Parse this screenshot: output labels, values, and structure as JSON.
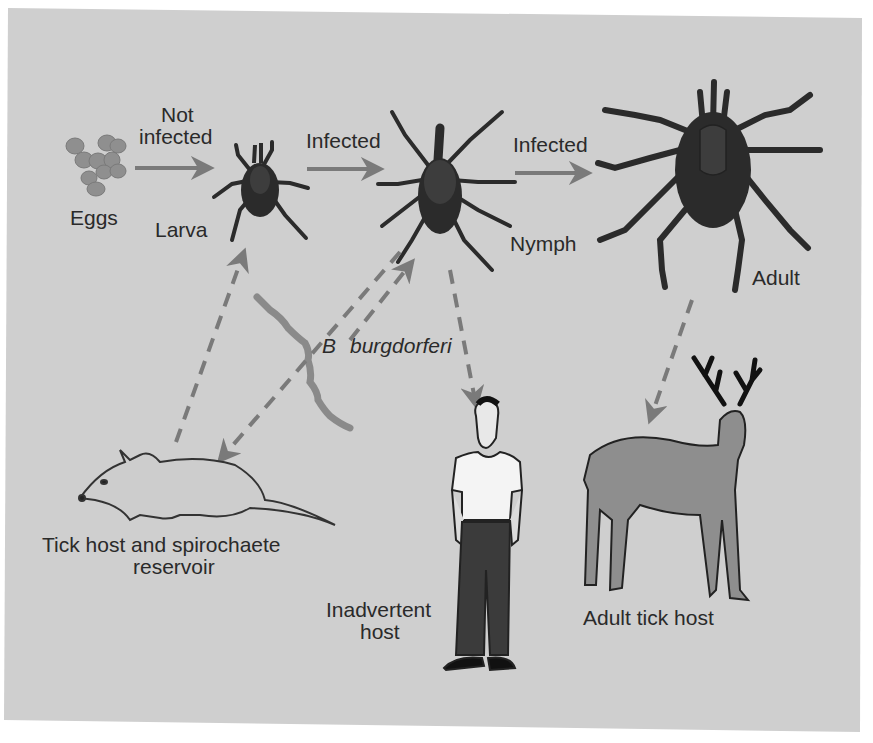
{
  "diagram": {
    "colors": {
      "panel": "#cfcfcf",
      "tick": "#2b2b2b",
      "tick_shield": "#3d3d3d",
      "arrow": "#7a7a7a",
      "eggs": "#8f8f8f",
      "spirochete": "#8a8a8a",
      "deer": "#8e8e8e",
      "mouse": "#cdcdcd",
      "text": "#2a2a2a"
    },
    "stages": {
      "eggs": "Eggs",
      "larva": "Larva",
      "nymph": "Nymph",
      "adult": "Adult"
    },
    "transitions": {
      "eggs_to_larva_line1": "Not",
      "eggs_to_larva_line2": "infected",
      "larva_to_nymph": "Infected",
      "nymph_to_adult": "Infected"
    },
    "pathogen": {
      "genus": "B",
      "species": "burgdorferi"
    },
    "hosts": {
      "reservoir_line1": "Tick host and spirochaete",
      "reservoir_line2": "reservoir",
      "inadvertent_line1": "Inadvertent",
      "inadvertent_line2": "host",
      "adult_host": "Adult tick host"
    }
  }
}
